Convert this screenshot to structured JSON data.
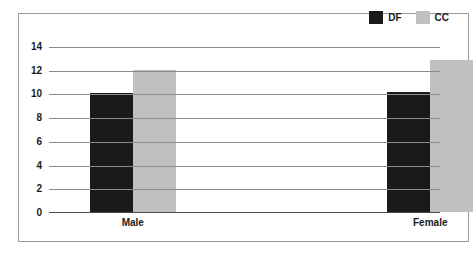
{
  "caption": {
    "text": "Gender."
  },
  "legend": {
    "position": "top-right",
    "items": [
      {
        "label": "DF",
        "color": "#1a1a1a",
        "icon": "legend-swatch-icon"
      },
      {
        "label": "CC",
        "color": "#c0c0c0",
        "icon": "legend-swatch-icon"
      }
    ]
  },
  "colors": {
    "df": "#1a1a1a",
    "cc": "#c0c0c0",
    "frame": "#9a9a9a",
    "gridline": "#8c8c8c",
    "axis": "#4a4a4a",
    "text": "#1a1a1a",
    "background": "#ffffff"
  },
  "chart_data": {
    "type": "bar",
    "title": "",
    "xlabel": "",
    "ylabel": "",
    "categories": [
      "Male",
      "Female"
    ],
    "series": [
      {
        "name": "DF",
        "color": "#1a1a1a",
        "values": [
          10,
          10.1
        ]
      },
      {
        "name": "CC",
        "color": "#c0c0c0",
        "values": [
          12,
          12.8
        ]
      }
    ],
    "ylim": [
      0,
      14
    ],
    "yticks": [
      0,
      2,
      4,
      6,
      8,
      10,
      12,
      14
    ],
    "ytick_labels": [
      "0",
      "2",
      "4",
      "6",
      "8",
      "10",
      "12",
      "14"
    ],
    "grid": true,
    "grid_axis": "y",
    "legend_position": "top-right"
  }
}
